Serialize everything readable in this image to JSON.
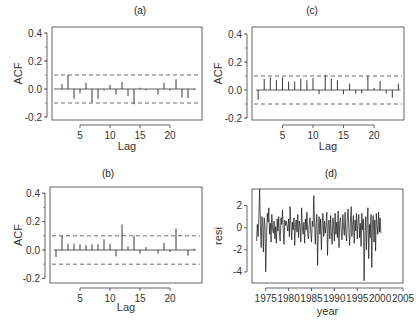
{
  "chart_data": [
    {
      "id": "a",
      "type": "bar",
      "title": "(a)",
      "xlabel": "Lag",
      "ylabel": "ACF",
      "ylim": [
        -0.2,
        0.4
      ],
      "yticks": [
        -0.2,
        0.0,
        0.2,
        0.4
      ],
      "xticks": [
        5,
        10,
        15,
        20
      ],
      "confidence_band": 0.1,
      "lags": [
        1,
        2,
        3,
        4,
        5,
        6,
        7,
        8,
        9,
        10,
        11,
        12,
        13,
        14,
        15,
        16,
        17,
        18,
        19,
        20,
        21,
        22,
        23,
        24
      ],
      "values": [
        0.0,
        0.035,
        0.1,
        -0.07,
        -0.03,
        0.045,
        -0.095,
        -0.07,
        -0.01,
        0.03,
        -0.04,
        0.05,
        -0.05,
        -0.11,
        0.01,
        -0.01,
        0.0,
        -0.04,
        0.045,
        -0.01,
        0.07,
        -0.06,
        -0.065,
        -0.005
      ]
    },
    {
      "id": "c",
      "type": "bar",
      "title": "(c)",
      "xlabel": "Lag",
      "ylabel": "ACF",
      "ylim": [
        -0.2,
        0.4
      ],
      "yticks": [
        -0.2,
        0.0,
        0.2,
        0.4
      ],
      "xticks": [
        5,
        10,
        15,
        20
      ],
      "confidence_band": 0.1,
      "lags": [
        1,
        2,
        3,
        4,
        5,
        6,
        7,
        8,
        9,
        10,
        11,
        12,
        13,
        14,
        15,
        16,
        17,
        18,
        19,
        20,
        21,
        22,
        23,
        24
      ],
      "values": [
        -0.07,
        0.08,
        0.09,
        0.07,
        0.09,
        0.06,
        0.06,
        0.08,
        0.07,
        0.085,
        -0.03,
        0.11,
        0.08,
        0.07,
        -0.03,
        0.045,
        -0.025,
        -0.025,
        0.1,
        0.015,
        0.065,
        -0.025,
        -0.055,
        0.045
      ]
    },
    {
      "id": "b",
      "type": "bar",
      "title": "(b)",
      "xlabel": "Lag",
      "ylabel": "ACF",
      "ylim": [
        -0.2,
        0.4
      ],
      "yticks": [
        -0.2,
        0.0,
        0.2,
        0.4
      ],
      "xticks": [
        5,
        10,
        15,
        20
      ],
      "confidence_band": 0.1,
      "lags": [
        1,
        2,
        3,
        4,
        5,
        6,
        7,
        8,
        9,
        10,
        11,
        12,
        13,
        14,
        15,
        16,
        17,
        18,
        19,
        20,
        21,
        22,
        23,
        24
      ],
      "values": [
        -0.05,
        0.1,
        0.045,
        0.045,
        0.04,
        0.035,
        0.04,
        0.04,
        0.075,
        0.045,
        -0.045,
        0.18,
        0.025,
        0.1,
        -0.025,
        0.02,
        0.0,
        -0.025,
        0.05,
        -0.015,
        0.15,
        0.0,
        -0.04,
        0.01
      ]
    },
    {
      "id": "d",
      "type": "line",
      "title": "(d)",
      "xlabel": "year",
      "ylabel": "resi",
      "xlim": [
        1972,
        2005
      ],
      "ylim": [
        -5,
        3.5
      ],
      "xticks": [
        1975,
        1980,
        1985,
        1990,
        1995,
        2000,
        2005
      ],
      "yticks": [
        -4,
        -2,
        0,
        2
      ],
      "x_start": 1973.0,
      "x_step": 0.1667,
      "values": [
        -1.2,
        0.3,
        -0.8,
        1.1,
        3.5,
        0.2,
        -1.8,
        1.0,
        0.4,
        -2.2,
        0.9,
        0.2,
        -4.0,
        -0.9,
        1.3,
        0.5,
        1.8,
        -0.6,
        0.4,
        -1.3,
        1.2,
        -0.2,
        -0.5,
        0.6,
        -1.0,
        0.1,
        -1.4,
        0.8,
        -0.3,
        1.0,
        -0.7,
        -1.2,
        0.9,
        0.3,
        1.6,
        -0.4,
        -1.5,
        0.7,
        0.2,
        0.6,
        0.1,
        -0.3,
        0.8,
        -0.8,
        1.9,
        0.4,
        -1.1,
        0.5,
        -0.2,
        0.9,
        -1.6,
        0.3,
        0.7,
        -0.4,
        1.2,
        -0.9,
        0.6,
        0.2,
        -1.3,
        1.8,
        0.1,
        -0.6,
        0.5,
        -1.4,
        0.8,
        -0.2,
        1.4,
        -0.5,
        -1.0,
        0.3,
        0.9,
        -0.3,
        -1.3,
        0.6,
        0.1,
        2.9,
        0.5,
        -1.5,
        0.4,
        1.2,
        -3.4,
        0.2,
        1.0,
        -0.6,
        0.8,
        -2.0,
        0.4,
        1.3,
        -0.8,
        0.6,
        -0.5,
        0.2,
        1.4,
        -2.5,
        0.3,
        0.7,
        -1.0,
        1.1,
        -0.4,
        -1.5,
        0.9,
        0.2,
        -1.2,
        1.3,
        -0.6,
        0.5,
        -0.9,
        1.5,
        -1.8,
        0.4,
        0.9,
        -0.3,
        -1.1,
        1.2,
        0.1,
        -0.7,
        1.4,
        -0.4,
        -1.2,
        0.8,
        1.7,
        -0.2,
        -1.6,
        0.6,
        1.9,
        -0.8,
        0.3,
        1.1,
        -1.4,
        0.7,
        -0.3,
        1.3,
        -1.0,
        0.5,
        1.2,
        -0.9,
        0.4,
        -1.7,
        1.3,
        -0.2,
        0.8,
        -4.8,
        -0.5,
        1.0,
        -2.0,
        0.6,
        1.8,
        -2.8,
        0.3,
        -0.9,
        1.2,
        -3.6,
        0.5,
        1.1,
        -1.3,
        0.7,
        -2.1,
        1.3,
        0.2,
        -0.6,
        1.4,
        -0.4,
        0.9,
        -0.5
      ]
    }
  ]
}
